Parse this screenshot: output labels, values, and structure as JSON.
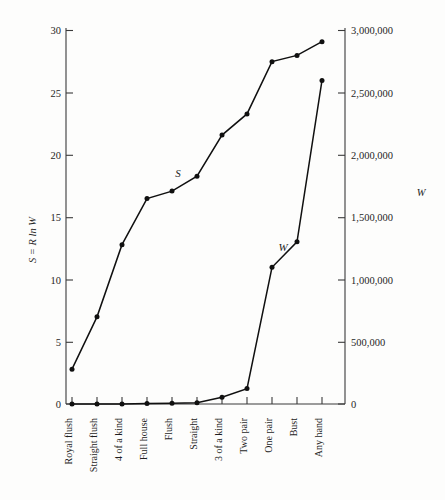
{
  "chart_data": {
    "type": "line",
    "title": "",
    "subtitle": "",
    "xlabel": "",
    "ylabel": "S = R ln W",
    "ylabel_right": "W",
    "grid": false,
    "legend": "inline-annotations",
    "categories": [
      "Royal flush",
      "Straight flush",
      "4 of a kind",
      "Full house",
      "Flush",
      "Straight",
      "3 of a kind",
      "Two pair",
      "One pair",
      "Bust",
      "Any hand"
    ],
    "ylim": [
      0,
      30
    ],
    "ylim_right": [
      0,
      3000000
    ],
    "yticks": [
      0,
      5,
      10,
      15,
      20,
      25,
      30
    ],
    "ytick_labels": [
      "0",
      "5",
      "10",
      "15",
      "20",
      "25",
      "30"
    ],
    "yticks_right": [
      0,
      500000,
      1000000,
      1500000,
      2000000,
      2500000,
      3000000
    ],
    "ytick_labels_right": [
      "0",
      "500,000",
      "1,000,000",
      "1,500,000",
      "2,000,000",
      "2,500,000",
      "3,000,000"
    ],
    "series": [
      {
        "name": "S",
        "axis": "left",
        "label": "S",
        "values": [
          2.8,
          7.0,
          12.8,
          16.5,
          17.1,
          18.3,
          21.6,
          23.3,
          27.5,
          28.0,
          29.1
        ]
      },
      {
        "name": "W",
        "axis": "right",
        "label": "W",
        "values": [
          4,
          36,
          624,
          3744,
          5108,
          10200,
          54912,
          123552,
          1098240,
          1302540,
          2598960
        ]
      }
    ],
    "annotations": [
      {
        "text": "S",
        "series": "S",
        "x_px": 178,
        "y_px": 177
      },
      {
        "text": "W",
        "series": "W",
        "x_px": 283,
        "y_px": 251
      }
    ]
  },
  "axes": {
    "left_title": "S = R ln W",
    "right_title": "W"
  }
}
